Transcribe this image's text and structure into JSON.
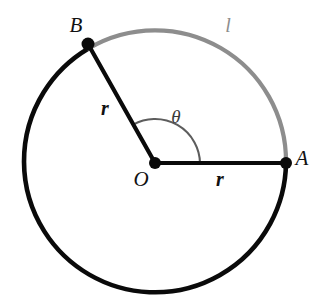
{
  "diagram": {
    "kind": "circle-arc-angle-diagram",
    "background_color": "#ffffff",
    "canvas": {
      "width": 324,
      "height": 308
    },
    "circle": {
      "center_x": 155,
      "center_y": 163,
      "radius": 131
    },
    "colors": {
      "black": "#0a0a0a",
      "gray": "#8d8d8d",
      "angle_arc": "#5d5d5d",
      "label_dark": "#111111",
      "label_gray": "#8d8d8d"
    },
    "points": [
      {
        "id": "A",
        "label": "A",
        "x": 286,
        "y": 163,
        "angle_deg": 0,
        "label_x": 302,
        "label_y": 160
      },
      {
        "id": "B",
        "label": "B",
        "x": 88,
        "y": 44,
        "angle_deg": 119,
        "label_x": 76,
        "label_y": 27
      },
      {
        "id": "O",
        "label": "O",
        "x": 155,
        "y": 163,
        "angle_deg": null,
        "label_x": 141,
        "label_y": 181
      }
    ],
    "segments": [
      {
        "id": "OA",
        "label": "r",
        "from": "O",
        "to": "A",
        "label_x": 220,
        "label_y": 181,
        "color": "#0a0a0a"
      },
      {
        "id": "OB",
        "label": "r",
        "from": "O",
        "to": "B",
        "label_x": 105,
        "label_y": 110,
        "color": "#0a0a0a"
      }
    ],
    "arcs": [
      {
        "id": "arc-l",
        "label": "l",
        "from": "A",
        "to": "B",
        "start_angle_deg": 0,
        "end_angle_deg": 119,
        "sweep_deg": 119,
        "color": "#8d8d8d",
        "label_x": 228,
        "label_y": 27
      },
      {
        "id": "arc-major",
        "label": "",
        "from": "B",
        "to": "A",
        "start_angle_deg": 119,
        "end_angle_deg": 360,
        "sweep_deg": 241,
        "color": "#0a0a0a",
        "label_x": null,
        "label_y": null
      }
    ],
    "angle": {
      "id": "theta",
      "label": "θ",
      "vertex": "O",
      "from_angle_deg": 0,
      "to_angle_deg": 119,
      "arc_radius": 45,
      "label_x": 176,
      "label_y": 119,
      "color": "#5d5d5d"
    }
  }
}
